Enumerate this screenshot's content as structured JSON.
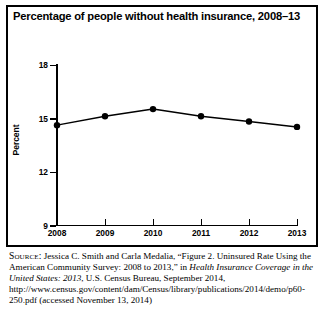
{
  "figure": {
    "title": "Percentage of people without health insurance, 2008–13",
    "frame_color": "#000000",
    "background": "#ffffff"
  },
  "chart_data": {
    "type": "line",
    "title": "Percentage of people without health insurance, 2008–13",
    "xlabel": "",
    "ylabel": "Percent",
    "categories": [
      "2008",
      "2009",
      "2010",
      "2011",
      "2012",
      "2013"
    ],
    "x": [
      2008,
      2009,
      2010,
      2011,
      2012,
      2013
    ],
    "values": [
      14.6,
      15.1,
      15.5,
      15.1,
      14.8,
      14.5
    ],
    "series": [
      {
        "name": "Percentage without health insurance",
        "values": [
          14.6,
          15.1,
          15.5,
          15.1,
          14.8,
          14.5
        ]
      }
    ],
    "ylim": [
      9,
      18
    ],
    "yticks": [
      18,
      15,
      12,
      9
    ],
    "ytick_labels": [
      "18",
      "15",
      "12",
      "9"
    ],
    "xticks": [
      2008,
      2009,
      2010,
      2011,
      2012,
      2013
    ],
    "xtick_labels": [
      "2008",
      "2009",
      "2010",
      "2011",
      "2012",
      "2013"
    ],
    "grid": false,
    "legend": "none",
    "line_color": "#000000",
    "marker": "filled-circle",
    "marker_color": "#000000"
  },
  "source": {
    "label": "Source:",
    "line1_a": " Jessica C. Smith and Carla Medalia, “Figure 2. Uninsured Rate Using the American Community Survey: 2008 to 2013,” in ",
    "title_italic": "Health Insurance Coverage in the United States: 2013",
    "line1_b": ", U.S. Census Bureau, September 2014, http://www.census.gov/content/dam/Census/library/publications/2014/demo/p60-250.pdf (accessed November 13, 2014)"
  }
}
